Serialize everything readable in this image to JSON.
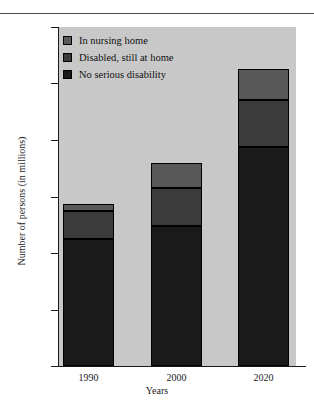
{
  "chart_data": {
    "type": "bar",
    "subtype": "stacked-bar",
    "title": "",
    "xlabel": "Years",
    "ylabel": "Number of persons (in millions)",
    "categories": [
      "1990",
      "2000",
      "2020"
    ],
    "ylim": [
      0,
      60
    ],
    "yticks": [
      0,
      10,
      20,
      30,
      40,
      50,
      60
    ],
    "ytick_labels": [
      "0",
      "10",
      "20",
      "30",
      "40",
      "50",
      "60"
    ],
    "grid": false,
    "legend_position": "upper-left-inside",
    "plot_background": "#c8c8c8",
    "series": [
      {
        "name": "No serious disability",
        "color": "#1a1a1a",
        "values": [
          22.5,
          24.7,
          38.7
        ]
      },
      {
        "name": "Disabled, still at home",
        "color": "#3b3b3b",
        "values": [
          5.0,
          6.8,
          8.3
        ]
      },
      {
        "name": "In nursing home",
        "color": "#585858",
        "values": [
          1.2,
          4.5,
          5.5
        ]
      }
    ],
    "stack_tops": {
      "1990": [
        22.5,
        27.5,
        28.7
      ],
      "2000": [
        24.7,
        31.5,
        36.0
      ],
      "2020": [
        38.7,
        47.0,
        52.5
      ]
    },
    "totals": [
      28.7,
      36.0,
      52.5
    ]
  },
  "legend": {
    "items": [
      {
        "label": "In nursing home",
        "color": "#585858"
      },
      {
        "label": "Disabled, still at home",
        "color": "#3b3b3b"
      },
      {
        "label": "No serious disability",
        "color": "#1a1a1a"
      }
    ]
  }
}
